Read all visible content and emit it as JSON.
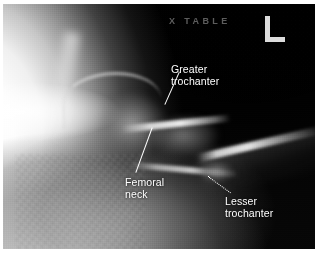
{
  "figure": {
    "modality": "radiograph",
    "view": "cross-table lateral hip",
    "background_color": "#ffffff",
    "film_color": "#050505"
  },
  "film_markers": {
    "projection_marker": "X TABLE",
    "side_marker_icon": "left-side-lead-marker",
    "side_marker_letter": "L"
  },
  "annotations": [
    {
      "id": "greater-trochanter",
      "label": "Greater\ntrochanter",
      "leader": "line-up-left-to-bone"
    },
    {
      "id": "femoral-neck",
      "label": "Femoral\nneck",
      "leader": "line-up-right-to-bone"
    },
    {
      "id": "lesser-trochanter",
      "label": "Lesser\ntrochanter",
      "leader": "dotted-line-up-left-to-bone"
    }
  ],
  "anatomy_regions": [
    "soft-tissue-overexposure-left",
    "acetabulum",
    "femoral-head",
    "femoral-neck",
    "greater-trochanter",
    "lesser-trochanter",
    "femoral-shaft",
    "air-field-upper-right"
  ],
  "colors": {
    "annotation_text": "#ffffff",
    "marker_text": "#969696",
    "side_marker": "#dcdcdc",
    "bright_tissue": "#ffffff",
    "film_black": "#050505"
  }
}
